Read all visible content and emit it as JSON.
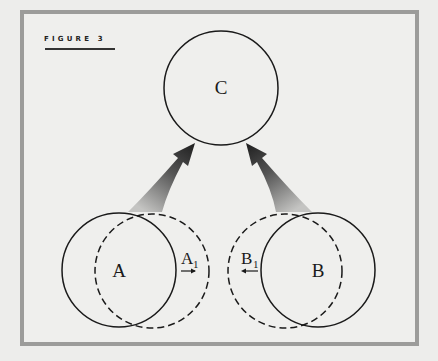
{
  "figure": {
    "label": "FIGURE 3"
  },
  "nodes": {
    "c": {
      "label": "C"
    },
    "a": {
      "label": "A"
    },
    "b": {
      "label": "B"
    },
    "a1": {
      "label": "A",
      "subscript": "1",
      "direction": "right"
    },
    "b1": {
      "label": "B",
      "subscript": "1",
      "direction": "left"
    }
  },
  "colors": {
    "frame": "#9c9c9a",
    "background": "#efefed",
    "stroke": "#1a1a1a",
    "arrow_dark": "#222222",
    "arrow_light": "#b0b0b0"
  }
}
